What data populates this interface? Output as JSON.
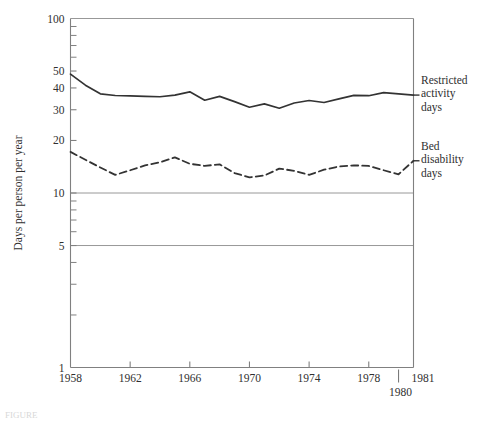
{
  "chart_data": {
    "type": "line",
    "title": "",
    "xlabel": "",
    "ylabel": "Days per person per year",
    "yscale": "log",
    "ylim": [
      1,
      100
    ],
    "xlim": [
      1958,
      1981
    ],
    "grid": "horizontal gridlines at 100, 10 and 5",
    "legend_position": "right of plot, beside line ends",
    "y_ticks_labeled": [
      "1",
      "5",
      "10",
      "20",
      "30",
      "40",
      "50",
      "100"
    ],
    "y_ticks_minor": [
      2,
      3,
      4,
      6,
      7,
      8,
      9,
      60,
      70,
      80,
      90
    ],
    "x_ticks_labeled": [
      "1958",
      "1962",
      "1966",
      "1970",
      "1974",
      "1978",
      "1981"
    ],
    "x_tick_extra": "1980",
    "x": [
      1958,
      1959,
      1960,
      1961,
      1962,
      1963,
      1964,
      1965,
      1966,
      1967,
      1968,
      1969,
      1970,
      1971,
      1972,
      1973,
      1974,
      1975,
      1976,
      1977,
      1978,
      1979,
      1980,
      1981
    ],
    "series": [
      {
        "name": "Restricted activity days",
        "style": "solid",
        "values": [
          48.0,
          41.5,
          37.0,
          36.2,
          36.0,
          35.8,
          35.6,
          36.4,
          38.0,
          34.0,
          35.8,
          33.4,
          31.0,
          32.4,
          30.6,
          32.8,
          33.9,
          33.0,
          34.6,
          36.3,
          36.1,
          37.6,
          37.0,
          36.4
        ]
      },
      {
        "name": "Bed disability days",
        "style": "dashed",
        "values": [
          17.2,
          15.5,
          14.0,
          12.7,
          13.5,
          14.4,
          15.0,
          16.0,
          14.7,
          14.3,
          14.6,
          13.0,
          12.3,
          12.6,
          13.8,
          13.4,
          12.7,
          13.6,
          14.2,
          14.4,
          14.3,
          13.5,
          12.8,
          15.3
        ]
      }
    ]
  },
  "axes": {
    "y_title": "Days per person per year",
    "y_labels": [
      {
        "value": 100,
        "text": "100"
      },
      {
        "value": 50,
        "text": "50"
      },
      {
        "value": 40,
        "text": "40"
      },
      {
        "value": 30,
        "text": "30"
      },
      {
        "value": 20,
        "text": "20"
      },
      {
        "value": 10,
        "text": "10"
      },
      {
        "value": 5,
        "text": "5"
      },
      {
        "value": 1,
        "text": "1"
      }
    ],
    "x_labels": [
      {
        "value": 1958,
        "text": "1958"
      },
      {
        "value": 1962,
        "text": "1962"
      },
      {
        "value": 1966,
        "text": "1966"
      },
      {
        "value": 1970,
        "text": "1970"
      },
      {
        "value": 1974,
        "text": "1974"
      },
      {
        "value": 1978,
        "text": "1978"
      },
      {
        "value": 1981,
        "text": "1981"
      }
    ],
    "x_label_below": {
      "value": 1980,
      "text": "1980"
    }
  },
  "series_labels": {
    "restricted": "Restricted\nactivity\ndays",
    "bed": "Bed\ndisability\ndays"
  },
  "caption": "FIGURE",
  "colors": {
    "line": "#333333",
    "axis": "#808080",
    "grid": "#8c8c8c",
    "text": "#2f2f2f"
  }
}
